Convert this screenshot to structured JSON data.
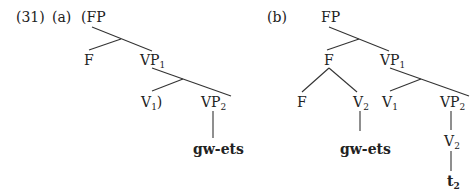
{
  "example": {
    "number": "(31)",
    "trees": [
      {
        "label": "(a)",
        "nodes": {
          "root": "(FP",
          "f": "F",
          "vp1": "VP",
          "vp1_sub": "1",
          "v1": "V",
          "v1_sub": "1",
          "v1_suffix": ")",
          "vp2": "VP",
          "vp2_sub": "2",
          "leaf": "gw-ets"
        }
      },
      {
        "label": "(b)",
        "nodes": {
          "root": "FP",
          "f": "F",
          "f_left": "F",
          "f_right_v2": "V",
          "f_right_v2_sub": "2",
          "leaf_left": "gw-ets",
          "vp1": "VP",
          "vp1_sub": "1",
          "v1": "V",
          "v1_sub": "1",
          "vp2": "VP",
          "vp2_sub": "2",
          "vp2_v2": "V",
          "vp2_v2_sub": "2",
          "trace": "t",
          "trace_sub": "2"
        }
      }
    ]
  }
}
